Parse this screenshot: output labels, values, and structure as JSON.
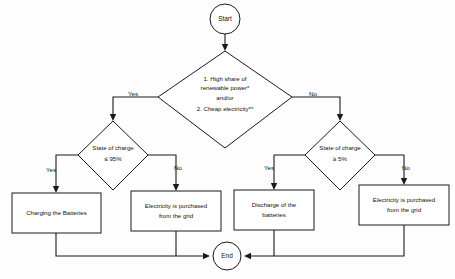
{
  "diagram": {
    "type": "flowchart",
    "colors": {
      "background": "#fdfdfd",
      "stroke": "#1a1a1a",
      "node_fill": "#ffffff",
      "text": "#101010"
    },
    "nodes": {
      "start": {
        "label": "Start",
        "shape": "terminator"
      },
      "decision_main": {
        "shape": "decision",
        "line1": "1. High share of",
        "line2": "renewable power*",
        "line3": "and/or",
        "line4": "2. Cheap electricity**"
      },
      "decision_left": {
        "shape": "decision",
        "line1": "State of charge",
        "line2": "≤ 95%"
      },
      "decision_right": {
        "shape": "decision",
        "line1": "State of charge",
        "line2": "≥ 5%"
      },
      "process_charging": {
        "shape": "process",
        "line1": "Charging the Batteries",
        "line2": ""
      },
      "process_purchase_left": {
        "shape": "process",
        "line1": "Electricity is purchased",
        "line2": "from the grid"
      },
      "process_discharge": {
        "shape": "process",
        "line1": "Discharge of the",
        "line2": "batteries"
      },
      "process_purchase_right": {
        "shape": "process",
        "line1": "Electricity is purchased",
        "line2": "from the grid"
      },
      "end": {
        "label": "End",
        "shape": "terminator"
      }
    },
    "edge_labels": {
      "main_yes": "Yes",
      "main_no": "No",
      "left_yes": "Yes",
      "left_no": "No",
      "right_yes": "Yes",
      "right_no": "No"
    }
  }
}
